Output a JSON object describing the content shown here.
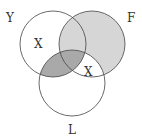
{
  "diagram": {
    "type": "venn",
    "sets": [
      {
        "name": "Y",
        "label": "Y"
      },
      {
        "name": "F",
        "label": "F"
      },
      {
        "name": "L",
        "label": "L"
      }
    ],
    "markers": [
      {
        "region": "Y only",
        "text": "X"
      },
      {
        "region": "F and L only",
        "text": "X"
      }
    ],
    "shaded_regions": [
      {
        "region": "F (excluding F∩L-only)",
        "shade": "light"
      },
      {
        "region": "Y∩L",
        "shade": "dark"
      }
    ],
    "colors": {
      "light": "#d6d6d6",
      "dark": "#a9a9a9",
      "stroke": "#444444"
    }
  }
}
